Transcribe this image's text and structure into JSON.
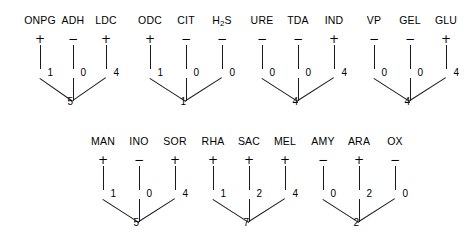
{
  "diagram": {
    "line_color": "#1a1a1a",
    "positive_sign": "+",
    "negative_sign": "−",
    "rows": [
      {
        "name": "row-1",
        "top": 14,
        "groups": [
          {
            "name": "group-onpg-adh-ldc",
            "left": 40,
            "spacing": 33,
            "sum": "5",
            "tests": [
              {
                "label": "ONPG",
                "sign": "+",
                "value": "1"
              },
              {
                "label": "ADH",
                "sign": "−",
                "value": "0"
              },
              {
                "label": "LDC",
                "sign": "+",
                "value": "4"
              }
            ]
          },
          {
            "name": "group-odc-cit-h2s",
            "left": 150,
            "spacing": 36,
            "sum": "1",
            "tests": [
              {
                "label": "ODC",
                "sign": "+",
                "value": "1"
              },
              {
                "label": "CIT",
                "sign": "−",
                "value": "0"
              },
              {
                "label": "H2S",
                "label_html": "H<sub>2</sub>S",
                "sign": "−",
                "value": "0"
              }
            ]
          },
          {
            "name": "group-ure-tda-ind",
            "left": 262,
            "spacing": 36,
            "sum": "4",
            "tests": [
              {
                "label": "URE",
                "sign": "−",
                "value": "0"
              },
              {
                "label": "TDA",
                "sign": "−",
                "value": "0"
              },
              {
                "label": "IND",
                "sign": "+",
                "value": "4"
              }
            ]
          },
          {
            "name": "group-vp-gel-glu",
            "left": 374,
            "spacing": 36,
            "sum": "4",
            "tests": [
              {
                "label": "VP",
                "sign": "−",
                "value": "0"
              },
              {
                "label": "GEL",
                "sign": "−",
                "value": "0"
              },
              {
                "label": "GLU",
                "sign": "+",
                "value": "4"
              }
            ]
          }
        ]
      },
      {
        "name": "row-2",
        "top": 135,
        "groups": [
          {
            "name": "group-man-ino-sor",
            "left": 103,
            "spacing": 36,
            "sum": "5",
            "tests": [
              {
                "label": "MAN",
                "sign": "+",
                "value": "1"
              },
              {
                "label": "INO",
                "sign": "−",
                "value": "0"
              },
              {
                "label": "SOR",
                "sign": "+",
                "value": "4"
              }
            ]
          },
          {
            "name": "group-rha-sac-mel",
            "left": 213,
            "spacing": 36,
            "sum": "7",
            "tests": [
              {
                "label": "RHA",
                "sign": "+",
                "value": "1"
              },
              {
                "label": "SAC",
                "sign": "+",
                "value": "2"
              },
              {
                "label": "MEL",
                "sign": "+",
                "value": "4"
              }
            ]
          },
          {
            "name": "group-amy-ara-ox",
            "left": 323,
            "spacing": 36,
            "sum": "2",
            "tests": [
              {
                "label": "AMY",
                "sign": "−",
                "value": "0"
              },
              {
                "label": "ARA",
                "sign": "+",
                "value": "2"
              },
              {
                "label": "OX",
                "sign": "−",
                "value": "0"
              }
            ]
          }
        ]
      }
    ]
  }
}
